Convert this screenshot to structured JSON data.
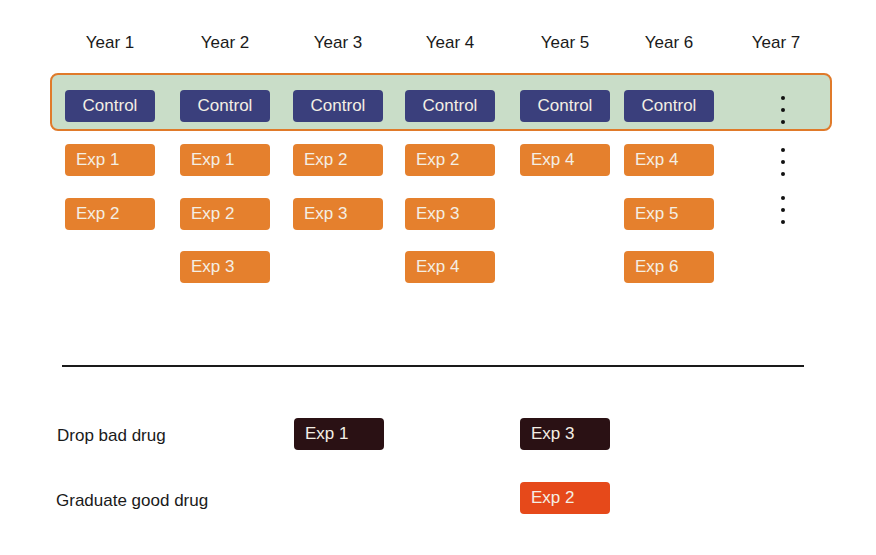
{
  "years": [
    "Year 1",
    "Year 2",
    "Year 3",
    "Year 4",
    "Year 5",
    "Year 6",
    "Year 7"
  ],
  "control_label": "Control",
  "columns": [
    {
      "control": "Control",
      "exps": [
        "Exp 1",
        "Exp 2"
      ]
    },
    {
      "control": "Control",
      "exps": [
        "Exp 1",
        "Exp 2",
        "Exp 3"
      ]
    },
    {
      "control": "Control",
      "exps": [
        "Exp 2",
        "Exp 3"
      ]
    },
    {
      "control": "Control",
      "exps": [
        "Exp 2",
        "Exp 3",
        "Exp 4"
      ]
    },
    {
      "control": "Control",
      "exps": [
        "Exp 4"
      ]
    },
    {
      "control": "Control",
      "exps": [
        "Exp 4",
        "Exp 5",
        "Exp 6"
      ]
    }
  ],
  "outcomes": {
    "drop": {
      "label": "Drop bad drug",
      "items": [
        {
          "year": 3,
          "text": "Exp 1"
        },
        {
          "year": 5,
          "text": "Exp 3"
        }
      ]
    },
    "graduate": {
      "label": "Graduate good drug",
      "items": [
        {
          "year": 5,
          "text": "Exp 2"
        }
      ]
    }
  },
  "colors": {
    "control": "#3a3f7c",
    "experiment": "#e5802d",
    "control_band": "#c9ddc8",
    "band_border": "#e07a2a",
    "drop": "#2a1114",
    "graduate": "#e6491a"
  }
}
